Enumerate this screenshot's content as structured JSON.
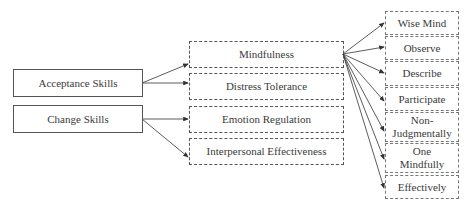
{
  "diagram": {
    "left": [
      {
        "label": "Acceptance Skills"
      },
      {
        "label": "Change Skills"
      }
    ],
    "middle": [
      {
        "label": "Mindfulness"
      },
      {
        "label": "Distress Tolerance"
      },
      {
        "label": "Emotion Regulation"
      },
      {
        "label": "Interpersonal Effectiveness"
      }
    ],
    "right": [
      {
        "label": "Wise Mind"
      },
      {
        "label": "Observe"
      },
      {
        "label": "Describe"
      },
      {
        "label": "Participate"
      },
      {
        "label": "Non-\nJudgmentally"
      },
      {
        "label": "One\nMindfully"
      },
      {
        "label": "Effectively"
      }
    ],
    "edges": [
      {
        "from": "Acceptance Skills",
        "to": "Mindfulness"
      },
      {
        "from": "Acceptance Skills",
        "to": "Distress Tolerance"
      },
      {
        "from": "Change Skills",
        "to": "Emotion Regulation"
      },
      {
        "from": "Change Skills",
        "to": "Interpersonal Effectiveness"
      },
      {
        "from": "Mindfulness",
        "to": "Wise Mind"
      },
      {
        "from": "Mindfulness",
        "to": "Observe"
      },
      {
        "from": "Mindfulness",
        "to": "Describe"
      },
      {
        "from": "Mindfulness",
        "to": "Participate"
      },
      {
        "from": "Mindfulness",
        "to": "Non-Judgmentally"
      },
      {
        "from": "Mindfulness",
        "to": "One Mindfully"
      },
      {
        "from": "Mindfulness",
        "to": "Effectively"
      }
    ]
  }
}
